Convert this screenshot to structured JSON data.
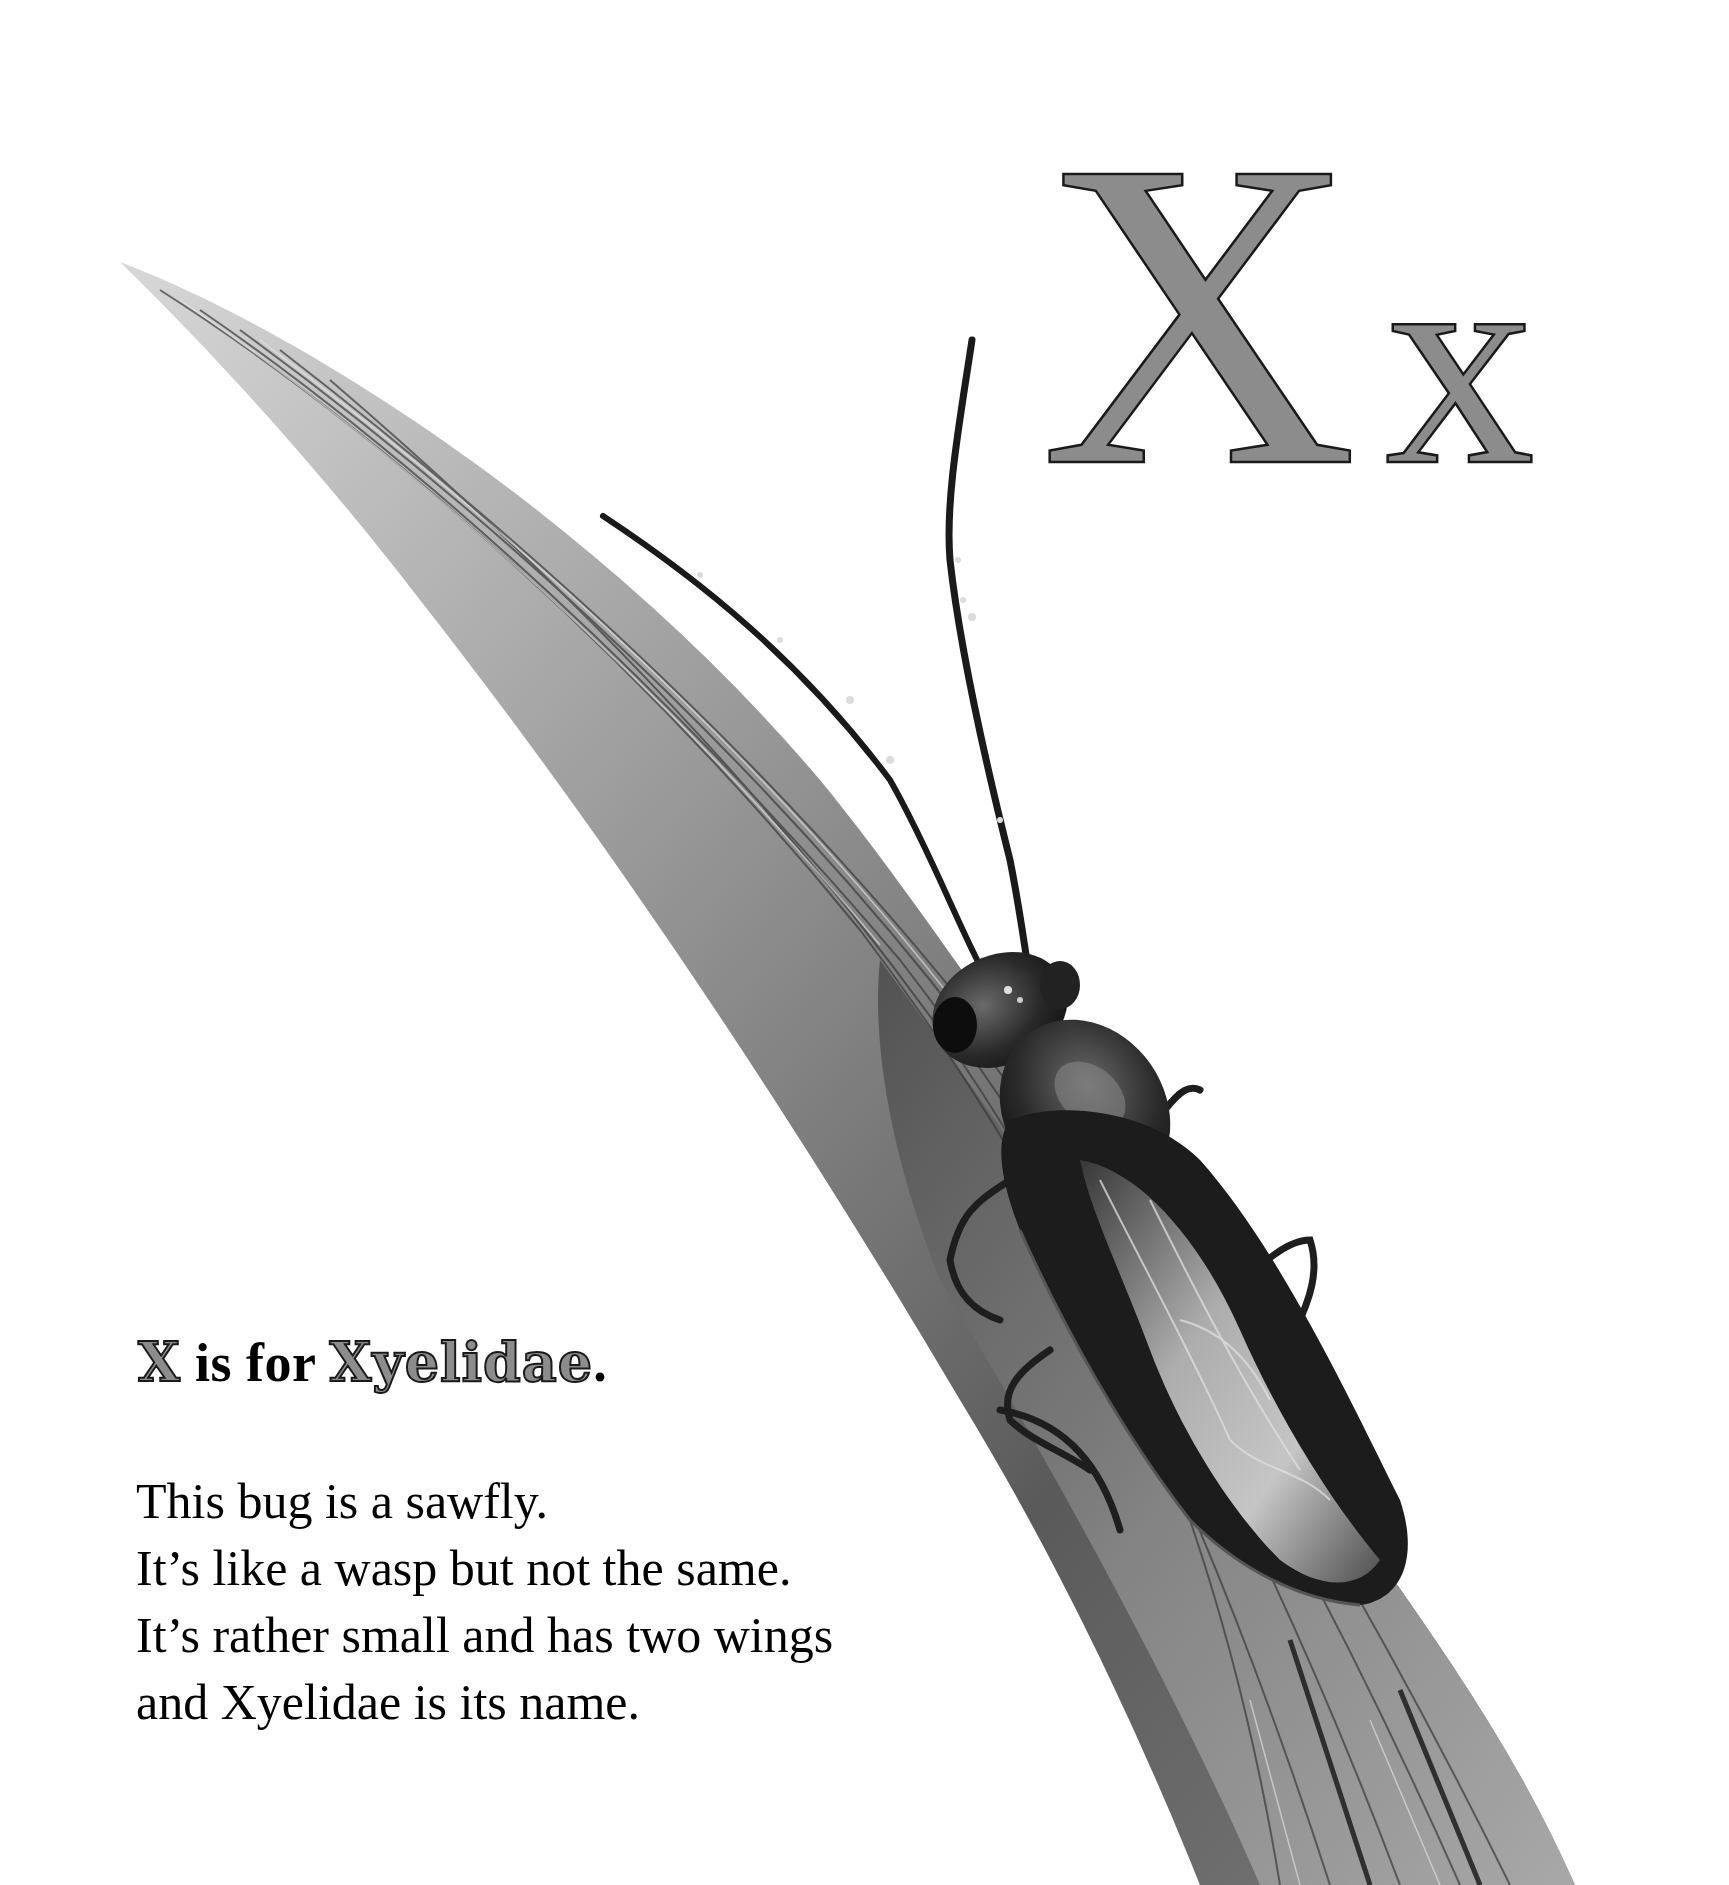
{
  "page": {
    "letter_upper": "X",
    "letter_lower": "x",
    "letter_fill": "#8c8c8c",
    "letter_outline": "#1a1a1a"
  },
  "heading": {
    "letter": "X",
    "connector": " is for ",
    "word": "Xyelidae",
    "end": "."
  },
  "poem": {
    "lines": [
      "This bug is a sawfly.",
      "It’s like a wasp but not the same.",
      "It’s rather small and has two wings",
      "and Xyelidae is its name."
    ]
  },
  "illustration": {
    "subject": "sawfly (Xyelidae) on a grass blade",
    "style": "grayscale painting"
  }
}
